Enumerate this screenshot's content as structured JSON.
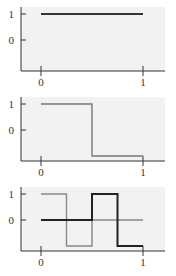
{
  "chart_data": [
    {
      "type": "line",
      "title": "",
      "xlabel": "",
      "ylabel": "",
      "x_ticks": [
        "0",
        "1"
      ],
      "y_ticks": [
        "1",
        "0"
      ],
      "xlim": [
        0,
        1
      ],
      "ylim": [
        -1,
        1.2
      ],
      "series": [
        {
          "name": "constant",
          "color": "#333333",
          "width": 2.2,
          "points": [
            [
              0,
              1
            ],
            [
              1,
              1
            ]
          ]
        }
      ]
    },
    {
      "type": "line",
      "title": "",
      "xlabel": "",
      "ylabel": "",
      "x_ticks": [
        "0",
        "1"
      ],
      "y_ticks": [
        "1",
        "0"
      ],
      "xlim": [
        0,
        1
      ],
      "ylim": [
        -1,
        1.2
      ],
      "series": [
        {
          "name": "step-half",
          "color": "#777777",
          "width": 1.4,
          "points": [
            [
              0,
              1
            ],
            [
              0.5,
              1
            ],
            [
              0.5,
              -1
            ],
            [
              1,
              -1
            ]
          ]
        }
      ]
    },
    {
      "type": "line",
      "title": "",
      "xlabel": "",
      "ylabel": "",
      "x_ticks": [
        "0",
        "1"
      ],
      "y_ticks": [
        "1",
        "0"
      ],
      "xlim": [
        0,
        1
      ],
      "ylim": [
        -1,
        1.2
      ],
      "series": [
        {
          "name": "step-quarter-a",
          "color": "#888888",
          "width": 1.4,
          "points": [
            [
              0,
              1
            ],
            [
              0.25,
              1
            ],
            [
              0.25,
              -1
            ],
            [
              0.5,
              -1
            ],
            [
              0.5,
              0
            ],
            [
              1,
              0
            ]
          ]
        },
        {
          "name": "zero-then-step",
          "color": "#222222",
          "width": 2.0,
          "points": [
            [
              0,
              0
            ],
            [
              0.5,
              0
            ],
            [
              0.5,
              1
            ],
            [
              0.75,
              1
            ],
            [
              0.75,
              -1
            ],
            [
              1,
              -1
            ]
          ]
        }
      ]
    }
  ]
}
